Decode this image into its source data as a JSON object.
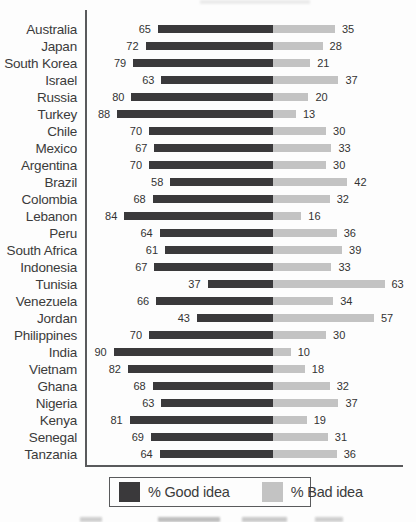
{
  "figure": {
    "legend": {
      "good_label": "% Good idea",
      "bad_label": "% Bad idea"
    },
    "colors": {
      "good_bar": "#3a393b",
      "bad_bar": "#c3c3c3",
      "axis_line": "#595a5c",
      "legend_border": "#595a5c",
      "country_text": "#3b3b3b",
      "value_text": "#333333"
    }
  },
  "chart_data": {
    "type": "bar",
    "subtype": "diverging-stacked-horizontal",
    "title": "",
    "xlabel": "",
    "ylabel": "",
    "value_labels_shown": true,
    "grid": false,
    "legend_position": "bottom",
    "axis": {
      "left_axis_line": true,
      "bottom_axis_line": true,
      "ticks": "none"
    },
    "categories": [
      "Australia",
      "Japan",
      "South Korea",
      "Israel",
      "Russia",
      "Turkey",
      "Chile",
      "Mexico",
      "Argentina",
      "Brazil",
      "Colombia",
      "Lebanon",
      "Peru",
      "South Africa",
      "Indonesia",
      "Tunisia",
      "Venezuela",
      "Jordan",
      "Philippines",
      "India",
      "Vietnam",
      "Ghana",
      "Nigeria",
      "Kenya",
      "Senegal",
      "Tanzania"
    ],
    "series": [
      {
        "name": "% Good idea",
        "values": [
          65,
          72,
          79,
          63,
          80,
          88,
          70,
          67,
          70,
          58,
          68,
          84,
          64,
          61,
          67,
          37,
          66,
          43,
          70,
          90,
          82,
          68,
          63,
          81,
          69,
          64
        ]
      },
      {
        "name": "% Bad idea",
        "values": [
          35,
          28,
          21,
          37,
          20,
          13,
          30,
          33,
          30,
          42,
          32,
          16,
          36,
          39,
          33,
          63,
          34,
          57,
          30,
          10,
          18,
          32,
          37,
          19,
          31,
          36
        ]
      }
    ]
  }
}
